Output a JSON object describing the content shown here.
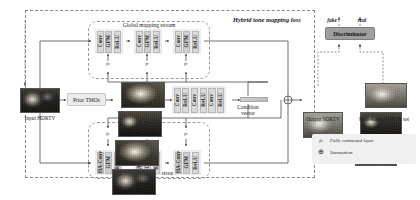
{
  "figure": {
    "outer_loss_label": "Hybrid tone mapping loss",
    "global_stream_title": "Global mapping stream",
    "local_stream_title": "Local adjustment stream"
  },
  "inputs": {
    "hdrtv_label": "Input HDRTV",
    "prior_tmos_label": "Prior TMOs"
  },
  "outputs": {
    "sdrtv_label": "Output SDRTV",
    "real_set_label": "Real-world SDRTV set"
  },
  "condition": {
    "vector_label_line1": "Condition",
    "vector_label_line2": "vector",
    "encoder_blocks": [
      "Conv",
      "ReLU",
      "Conv",
      "ReLU",
      "Conv",
      "ReLU"
    ]
  },
  "global_stream": {
    "groups": [
      {
        "blocks": [
          "Conv",
          "GFM",
          "ReLU"
        ],
        "fc": "fc"
      },
      {
        "blocks": [
          "Conv",
          "GFM",
          "ReLU"
        ],
        "fc": "fc"
      },
      {
        "blocks": [
          "Conv",
          "GFM",
          "ReLU"
        ],
        "fc": "fc"
      }
    ]
  },
  "local_stream": {
    "groups": [
      {
        "blocks": [
          "HA-Conv",
          "GFM",
          "ReLU"
        ],
        "fc": "fc"
      },
      {
        "blocks": [
          "HA-Conv",
          "GFM",
          "ReLU"
        ],
        "fc": "fc"
      },
      {
        "blocks": [
          "HA-Conv",
          "GFM",
          "ReLU"
        ],
        "fc": "fc"
      }
    ]
  },
  "discriminator": {
    "label": "Discriminator",
    "fake_label": "fake",
    "real_label": "real"
  },
  "legend": {
    "items": [
      {
        "key": "fc",
        "text": "Fully connected layer"
      },
      {
        "key": "⊕",
        "text": "Summation"
      }
    ]
  },
  "colors": {
    "block_fill": "#d9d9d9",
    "group_fill": "#ececec",
    "discriminator_fill": "#9e9e9e",
    "dash_stroke": "#8a8a8a",
    "wire_stroke": "#333333"
  }
}
